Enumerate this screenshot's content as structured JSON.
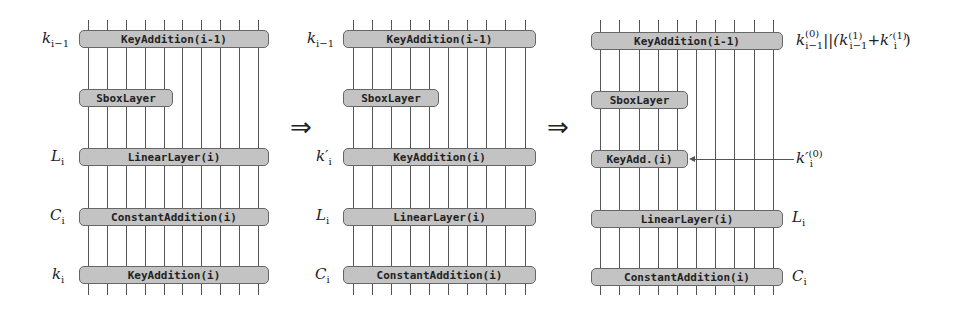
{
  "panels": [
    {
      "id": "left",
      "boxes": [
        {
          "label": "KeyAddition(i-1)",
          "side_label": "k_{i-1}"
        },
        {
          "label": "SboxLayer",
          "side_label": ""
        },
        {
          "label": "LinearLayer(i)",
          "side_label": "L_i"
        },
        {
          "label": "ConstantAddition(i)",
          "side_label": "C_i"
        },
        {
          "label": "KeyAddition(i)",
          "side_label": "k_i"
        }
      ]
    },
    {
      "id": "middle",
      "boxes": [
        {
          "label": "KeyAddition(i-1)",
          "side_label": "k_{i-1}"
        },
        {
          "label": "SboxLayer",
          "side_label": ""
        },
        {
          "label": "KeyAddition(i)",
          "side_label": "k'_i"
        },
        {
          "label": "LinearLayer(i)",
          "side_label": "L_i"
        },
        {
          "label": "ConstantAddition(i)",
          "side_label": "C_i"
        }
      ]
    },
    {
      "id": "right",
      "boxes": [
        {
          "label": "KeyAddition(i-1)",
          "side_label": "k_{i-1}^{(0)} || (k_{i-1}^{(1)} + k'_i^{(1)})"
        },
        {
          "label": "SboxLayer",
          "side_label": ""
        },
        {
          "label": "KeyAdd.(i)",
          "side_label": "k'_i^{(0)}"
        },
        {
          "label": "LinearLayer(i)",
          "side_label": "L_i"
        },
        {
          "label": "ConstantAddition(i)",
          "side_label": "C_i"
        }
      ]
    }
  ],
  "transitions": [
    "⇒",
    "⇒"
  ],
  "wires_per_panel": 10
}
